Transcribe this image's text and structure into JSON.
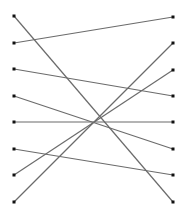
{
  "diagram": {
    "type": "bipartite-matching",
    "width": 193,
    "height": 214,
    "line_color": "#6b6b6b",
    "dot_color": "#111111",
    "left_x": 14,
    "right_x": 173,
    "left_nodes": [
      {
        "id": "L1",
        "y": 16
      },
      {
        "id": "L2",
        "y": 43
      },
      {
        "id": "L3",
        "y": 69
      },
      {
        "id": "L4",
        "y": 96
      },
      {
        "id": "L5",
        "y": 122
      },
      {
        "id": "L6",
        "y": 149
      },
      {
        "id": "L7",
        "y": 175
      },
      {
        "id": "L8",
        "y": 202
      }
    ],
    "right_nodes": [
      {
        "id": "R1",
        "y": 17
      },
      {
        "id": "R2",
        "y": 43
      },
      {
        "id": "R3",
        "y": 70
      },
      {
        "id": "R4",
        "y": 96
      },
      {
        "id": "R5",
        "y": 122
      },
      {
        "id": "R6",
        "y": 149
      },
      {
        "id": "R7",
        "y": 175
      },
      {
        "id": "R8",
        "y": 202
      }
    ],
    "edges": [
      {
        "from": "L1",
        "to": "R8"
      },
      {
        "from": "L2",
        "to": "R1"
      },
      {
        "from": "L3",
        "to": "R4"
      },
      {
        "from": "L4",
        "to": "R6"
      },
      {
        "from": "L5",
        "to": "R5"
      },
      {
        "from": "L6",
        "to": "R7"
      },
      {
        "from": "L7",
        "to": "R3"
      },
      {
        "from": "L8",
        "to": "R2"
      }
    ]
  }
}
